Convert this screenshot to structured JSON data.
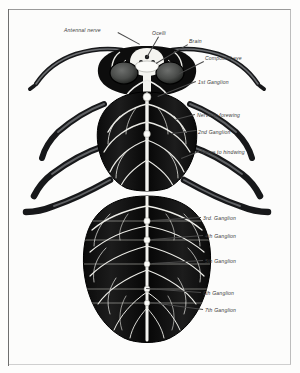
{
  "plate": {
    "subject": "Insect nervous system — dorsal dissection of a wasp / bee",
    "background_color": "#fdfdfc",
    "border_color": "#9a9a9a",
    "ink_color": "#111111",
    "nerve_color": "#f2f2ee",
    "label_color": "#3a3a3a"
  },
  "labels": [
    {
      "id": "antennal-nerve",
      "text": "Antennal nerve",
      "x": 64,
      "y": 28,
      "lead": {
        "x1": 118,
        "y1": 32,
        "x2": 140,
        "y2": 44
      }
    },
    {
      "id": "ocelli",
      "text": "Ocelli",
      "x": 152,
      "y": 31,
      "lead": {
        "x1": 159,
        "y1": 37,
        "x2": 147,
        "y2": 58
      }
    },
    {
      "id": "brain",
      "text": "Brain",
      "x": 189,
      "y": 39,
      "lead": {
        "x1": 188,
        "y1": 45,
        "x2": 156,
        "y2": 64
      }
    },
    {
      "id": "compound-eye",
      "text": "Compound eye",
      "x": 205,
      "y": 56,
      "lead": {
        "x1": 204,
        "y1": 62,
        "x2": 176,
        "y2": 76
      }
    },
    {
      "id": "first-ganglion",
      "text": "1st Ganglion",
      "x": 198,
      "y": 80,
      "lead": {
        "x1": 196,
        "y1": 82,
        "x2": 158,
        "y2": 97
      }
    },
    {
      "id": "nerve-forewing",
      "text": "Nerve to forewing",
      "x": 197,
      "y": 113,
      "lead": {
        "x1": 195,
        "y1": 115,
        "x2": 176,
        "y2": 120
      }
    },
    {
      "id": "second-ganglion",
      "text": "2nd Ganglion",
      "x": 198,
      "y": 130,
      "lead": {
        "x1": 196,
        "y1": 131,
        "x2": 172,
        "y2": 134
      }
    },
    {
      "id": "nerve-hindwing",
      "text": "Nerve to hindwing",
      "x": 201,
      "y": 150,
      "lead": {
        "x1": 199,
        "y1": 152,
        "x2": 181,
        "y2": 159
      }
    },
    {
      "id": "third-ganglion",
      "text": "3rd. Ganglion",
      "x": 203,
      "y": 216,
      "lead": {
        "x1": 201,
        "y1": 218,
        "x2": 152,
        "y2": 221
      }
    },
    {
      "id": "fourth-ganglion",
      "text": "4th Ganglion",
      "x": 205,
      "y": 234,
      "lead": {
        "x1": 203,
        "y1": 236,
        "x2": 152,
        "y2": 240
      }
    },
    {
      "id": "fifth-ganglion",
      "text": "5th Ganglion",
      "x": 205,
      "y": 259,
      "lead": {
        "x1": 203,
        "y1": 261,
        "x2": 152,
        "y2": 264
      }
    },
    {
      "id": "sixth-ganglion",
      "text": "6th Ganglion",
      "x": 203,
      "y": 291,
      "lead": {
        "x1": 201,
        "y1": 293,
        "x2": 146,
        "y2": 289
      }
    },
    {
      "id": "seventh-ganglion",
      "text": "7th Ganglion",
      "x": 205,
      "y": 308,
      "lead": {
        "x1": 203,
        "y1": 310,
        "x2": 150,
        "y2": 303
      }
    }
  ],
  "anatomy": {
    "head": {
      "label": "head-capsule",
      "cx": 147,
      "cy": 72
    },
    "eyes": [
      {
        "label": "compound-eye-left",
        "cx": 124,
        "cy": 73
      },
      {
        "label": "compound-eye-right",
        "cx": 170,
        "cy": 73
      }
    ],
    "ocelli_count": 3,
    "antennae": [
      {
        "label": "antenna-left"
      },
      {
        "label": "antenna-right"
      }
    ],
    "thorax": {
      "label": "thorax",
      "cy": 130
    },
    "abdomen": {
      "label": "abdomen",
      "cy": 265,
      "segments": 7
    },
    "legs": [
      {
        "label": "leg-fore-left"
      },
      {
        "label": "leg-fore-right"
      },
      {
        "label": "leg-mid-left"
      },
      {
        "label": "leg-mid-right"
      },
      {
        "label": "leg-hind-left"
      },
      {
        "label": "leg-hind-right"
      }
    ],
    "ganglia": [
      {
        "label": "ganglion-1",
        "cy": 97
      },
      {
        "label": "ganglion-2",
        "cy": 134
      },
      {
        "label": "ganglion-3",
        "cy": 221
      },
      {
        "label": "ganglion-4",
        "cy": 240
      },
      {
        "label": "ganglion-5",
        "cy": 264
      },
      {
        "label": "ganglion-6",
        "cy": 289
      },
      {
        "label": "ganglion-7",
        "cy": 303
      }
    ],
    "nerve_cord": {
      "label": "ventral-nerve-cord",
      "x": 147
    }
  }
}
